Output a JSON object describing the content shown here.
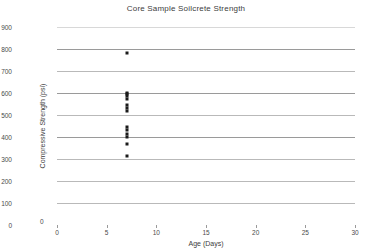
{
  "chart_data": {
    "type": "scatter",
    "title": "Core Sample Soilcrete Strength",
    "xlabel": "Age (Days)",
    "ylabel": "Compressive Strength (psi)",
    "xlim": [
      0,
      30
    ],
    "ylim": [
      0,
      900
    ],
    "xticks": [
      0,
      5,
      10,
      15,
      20,
      25,
      30
    ],
    "yticks": [
      0,
      100,
      200,
      300,
      400,
      500,
      600,
      700,
      800,
      900
    ],
    "xtick_labels": [
      "0",
      "5",
      "10",
      "15",
      "20",
      "25",
      "30"
    ],
    "ytick_labels": [
      "0",
      "100",
      "200",
      "300",
      "400",
      "500",
      "600",
      "700",
      "800",
      "900"
    ],
    "grid": true,
    "legend": false,
    "marker_color": "#1a1a1a",
    "grid_color": "#b9b9b9",
    "series": [
      {
        "name": "Core Samples",
        "x": [
          7,
          7,
          7,
          7,
          7,
          7,
          7,
          7,
          7,
          7,
          7,
          7,
          7,
          7
        ],
        "y": [
          780,
          600,
          595,
          585,
          575,
          545,
          530,
          520,
          445,
          430,
          415,
          400,
          370,
          315
        ]
      }
    ],
    "points": [
      {
        "x": 7,
        "y": 780
      },
      {
        "x": 7,
        "y": 600
      },
      {
        "x": 7,
        "y": 595
      },
      {
        "x": 7,
        "y": 585
      },
      {
        "x": 7,
        "y": 575
      },
      {
        "x": 7,
        "y": 545
      },
      {
        "x": 7,
        "y": 530
      },
      {
        "x": 7,
        "y": 520
      },
      {
        "x": 7,
        "y": 445
      },
      {
        "x": 7,
        "y": 430
      },
      {
        "x": 7,
        "y": 415
      },
      {
        "x": 7,
        "y": 400
      },
      {
        "x": 7,
        "y": 370
      },
      {
        "x": 7,
        "y": 315
      }
    ],
    "origin_label": "0"
  }
}
